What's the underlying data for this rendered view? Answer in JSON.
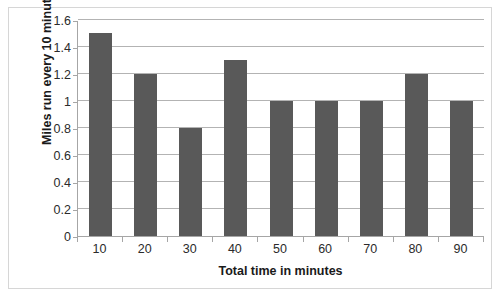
{
  "chart_data": {
    "type": "bar",
    "title": "",
    "xlabel": "Total time in minutes",
    "ylabel": "Miles run every 10 minutes",
    "categories": [
      "10",
      "20",
      "30",
      "40",
      "50",
      "60",
      "70",
      "80",
      "90"
    ],
    "values": [
      1.5,
      1.2,
      0.8,
      1.3,
      1.0,
      1.0,
      1.0,
      1.2,
      1.0
    ],
    "series": [
      {
        "name": "Miles run every 10 minutes",
        "values": [
          1.5,
          1.2,
          0.8,
          1.3,
          1.0,
          1.0,
          1.0,
          1.2,
          1.0
        ]
      }
    ],
    "ylim": [
      0,
      1.6
    ],
    "ytick_labels": [
      "0",
      "0.2",
      "0.4",
      "0.6",
      "0.8",
      "1",
      "1.2",
      "1.4",
      "1.6"
    ],
    "ytick_values": [
      0,
      0.2,
      0.4,
      0.6,
      0.8,
      1.0,
      1.2,
      1.4,
      1.6
    ],
    "xtick_labels": [
      "10",
      "20",
      "30",
      "40",
      "50",
      "60",
      "70",
      "80",
      "90"
    ],
    "grid": "horizontal",
    "legend": "none",
    "bar_color": "#595959",
    "gridline_color": "#b3b3b3",
    "axis_color": "#a6a6a6",
    "frame_color": "#d6d6d6",
    "background": "#ffffff"
  },
  "clipped_header_text": ""
}
